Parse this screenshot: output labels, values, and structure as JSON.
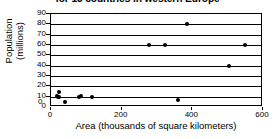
{
  "chart_data": {
    "type": "scatter",
    "title": "for 13 countries in western Europe",
    "xlabel": "Area (thousands of square kilometers)",
    "ylabel": "Population\n(millions)",
    "ylabel_line1": "Population",
    "ylabel_line2": "(millions)",
    "xlim": [
      0,
      600
    ],
    "ylim": [
      0,
      90
    ],
    "xticks": [
      0,
      200,
      400,
      600
    ],
    "xtick_labels": [
      "0",
      "200",
      "400",
      "600"
    ],
    "yticks": [
      0,
      10,
      20,
      30,
      40,
      50,
      60,
      70,
      80,
      90
    ],
    "ytick_labels": [
      "0",
      "10",
      "20",
      "30",
      "40",
      "50",
      "60",
      "70",
      "80",
      "90"
    ],
    "grid": true,
    "grid_axis": "y",
    "legend": false,
    "marker": "filled-circle",
    "marker_color": "#000000",
    "points": [
      {
        "x": 22,
        "y": 15
      },
      {
        "x": 16,
        "y": 11
      },
      {
        "x": 20,
        "y": 10
      },
      {
        "x": 24,
        "y": 10
      },
      {
        "x": 41,
        "y": 5
      },
      {
        "x": 79,
        "y": 10
      },
      {
        "x": 84,
        "y": 11
      },
      {
        "x": 115,
        "y": 10
      },
      {
        "x": 360,
        "y": 7
      },
      {
        "x": 277,
        "y": 60
      },
      {
        "x": 324,
        "y": 60
      },
      {
        "x": 385,
        "y": 80
      },
      {
        "x": 505,
        "y": 40
      },
      {
        "x": 550,
        "y": 60
      }
    ]
  },
  "axis": {
    "x_origin_label": "0"
  }
}
